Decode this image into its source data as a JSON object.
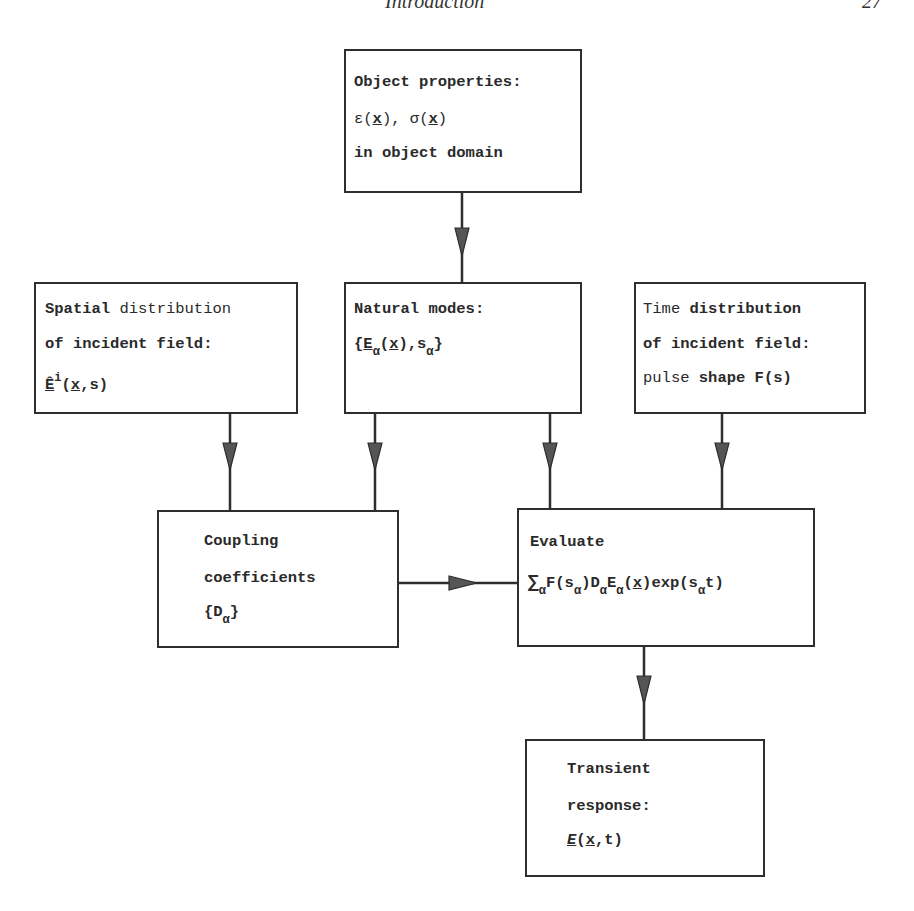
{
  "header": {
    "running_title": "Introduction",
    "page_number": "27"
  },
  "boxes": {
    "object_properties": {
      "line1": "Object properties:",
      "line2_eps": "ε(",
      "line2_x1": "x",
      "line2_mid": "), σ(",
      "line2_x2": "x",
      "line2_end": ")",
      "line3": "in object domain"
    },
    "spatial": {
      "line1_bold": "Spatial",
      "line1_rest": " distribution",
      "line2": "of incident field:",
      "line3_E": "Ê",
      "line3_sup": "i",
      "line3_open": "(",
      "line3_x": "x",
      "line3_rest": ",s)"
    },
    "natural_modes": {
      "line1": "Natural modes:",
      "line2_open": "{",
      "line2_E": "E",
      "line2_sub1": "α",
      "line2_paren_open": "(",
      "line2_x": "x",
      "line2_mid": "),s",
      "line2_sub2": "α",
      "line2_close": "}"
    },
    "time": {
      "line1_a": "Time ",
      "line1_b": "distribution",
      "line2": "of incident field:",
      "line3_a": "pulse ",
      "line3_b": "shape F(s)"
    },
    "coupling": {
      "line1": "Coupling",
      "line2": "coefficients",
      "line3_open": "{D",
      "line3_sub": "α",
      "line3_close": "}"
    },
    "evaluate": {
      "line1": "Evaluate",
      "sum": "∑",
      "sub_a": "α",
      "p1": "F(s",
      "sub_b": "α",
      "p2": ")D",
      "sub_c": "α",
      "p3": "E",
      "sub_d": "α",
      "p4": "(",
      "x": "x",
      "p5": ")exp(s",
      "sub_e": "α",
      "p6": "t)"
    },
    "transient": {
      "line1": "Transient",
      "line2": "response:",
      "line3_E": "E",
      "line3_open": "(",
      "line3_x": "x",
      "line3_rest": ",t)"
    }
  },
  "colors": {
    "line": "#2e2e2e",
    "arrow_fill": "#555555",
    "text": "#2a2a2a"
  }
}
